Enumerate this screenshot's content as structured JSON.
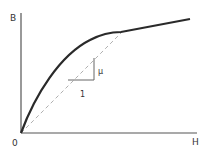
{
  "diagram": {
    "labels": {
      "y_axis": "B",
      "x_axis": "H",
      "origin": "0",
      "slope_rise": "μ",
      "slope_run": "1"
    },
    "elements": [
      {
        "id": "y-axis",
        "type": "axis"
      },
      {
        "id": "x-axis",
        "type": "axis"
      },
      {
        "id": "bh-curve",
        "type": "curve",
        "style": "solid-thick"
      },
      {
        "id": "secant-line",
        "type": "line",
        "style": "dashed"
      },
      {
        "id": "slope-triangle",
        "type": "triangle"
      }
    ],
    "colors": {
      "curve": "#2a2a2a",
      "axes": "#555555",
      "dashed": "#b0b0b0",
      "text": "#333333"
    }
  }
}
